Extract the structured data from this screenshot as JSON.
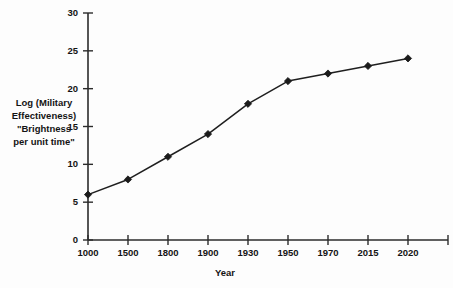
{
  "chart_data": {
    "type": "line",
    "title": "",
    "subtitle": "",
    "xlabel": "Year",
    "ylabel": "Log (Military Effectiveness) \"Brightness per unit time\"",
    "categories": [
      "1000",
      "1500",
      "1800",
      "1900",
      "1930",
      "1950",
      "1970",
      "2015",
      "2020"
    ],
    "values": [
      6,
      8,
      11,
      14,
      18,
      21,
      22,
      23,
      24
    ],
    "series": [
      {
        "name": "Log (Military Effectiveness)",
        "values": [
          6,
          8,
          11,
          14,
          18,
          21,
          22,
          23,
          24
        ]
      }
    ],
    "ylim": [
      0,
      30
    ],
    "ytick_labels": [
      "0",
      "5",
      "10",
      "15",
      "20",
      "25",
      "30"
    ],
    "ytick_values": [
      0,
      5,
      10,
      15,
      20,
      25,
      30
    ],
    "grid": false,
    "legend": false,
    "legend_position": "none",
    "marker": "diamond",
    "line_color": "#1f1f1f",
    "marker_color": "#1b1b1b",
    "axis_color": "#2b2b2b",
    "background_color": "#fdfdfd"
  },
  "axes": {
    "y_title_lines": [
      "Log (Military",
      "Effectiveness)",
      "\"Brightness",
      "per unit time\""
    ],
    "x_title": "Year"
  }
}
